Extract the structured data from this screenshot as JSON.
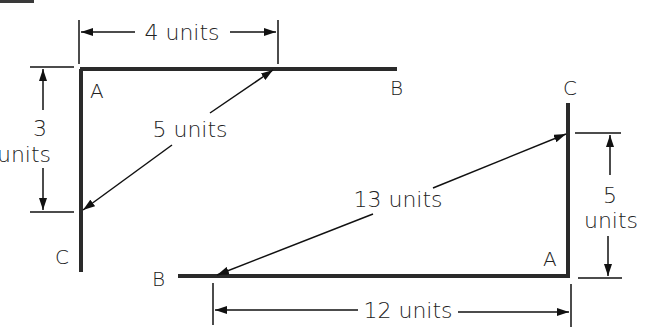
{
  "corner_tab": {
    "color": "#3a3a3a"
  },
  "triangle1": {
    "vertices": {
      "A": "A",
      "B": "B",
      "C": "C"
    },
    "side_AB": {
      "label": "4 units",
      "length": 4
    },
    "side_AC": {
      "label_number": "3",
      "label_units": "units",
      "length": 3
    },
    "hypotenuse_BC": {
      "label": "5 units",
      "length": 5
    }
  },
  "triangle2": {
    "vertices": {
      "A": "A",
      "B": "B",
      "C": "C"
    },
    "side_AB": {
      "label": "12 units",
      "length": 12
    },
    "side_AC": {
      "label_number": "5",
      "label_units": "units",
      "length": 5
    },
    "hypotenuse_BC": {
      "label": "13 units",
      "length": 13
    }
  }
}
